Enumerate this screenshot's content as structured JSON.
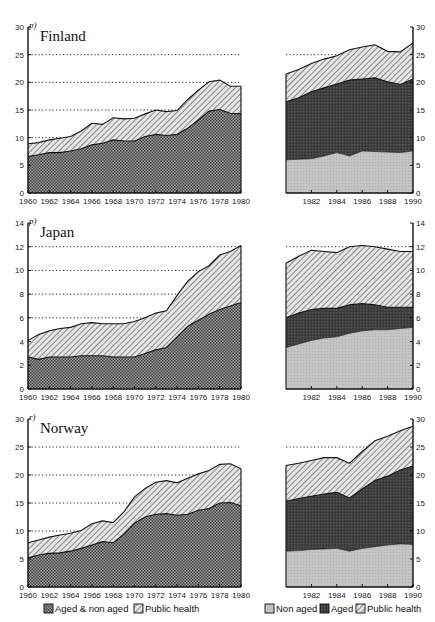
{
  "legend_left": [
    {
      "label": "Aged & non aged",
      "pattern": "checker"
    },
    {
      "label": "Public health",
      "pattern": "hatch"
    }
  ],
  "legend_right": [
    {
      "label": "Non aged",
      "pattern": "lightgray"
    },
    {
      "label": "Aged",
      "pattern": "dark"
    },
    {
      "label": "Public health",
      "pattern": "hatch"
    }
  ],
  "chart_data": [
    {
      "type": "area",
      "title": "Finland",
      "note": "p)",
      "ylim": [
        0,
        30
      ],
      "yticks": [
        0,
        5,
        10,
        15,
        20,
        25,
        30
      ],
      "grid": "dotted at 10,15,20,25",
      "left_panel": {
        "x": [
          1960,
          1961,
          1962,
          1963,
          1964,
          1965,
          1966,
          1967,
          1968,
          1969,
          1970,
          1971,
          1972,
          1973,
          1974,
          1975,
          1976,
          1977,
          1978,
          1979,
          1980
        ],
        "series": [
          {
            "name": "Aged & non aged",
            "values": [
              6.6,
              6.9,
              7.3,
              7.3,
              7.6,
              8.0,
              8.7,
              9.0,
              9.6,
              9.4,
              9.4,
              10.2,
              10.6,
              10.4,
              10.6,
              11.7,
              13.2,
              14.8,
              15.1,
              14.4,
              14.3
            ]
          },
          {
            "name": "Public health (total)",
            "values": [
              8.9,
              9.1,
              9.6,
              9.9,
              10.2,
              11.2,
              12.6,
              12.4,
              13.6,
              13.4,
              13.5,
              14.3,
              15.0,
              14.7,
              14.9,
              16.9,
              18.6,
              20.1,
              20.4,
              19.3,
              19.3
            ]
          }
        ]
      },
      "right_panel": {
        "x": [
          1980,
          1981,
          1982,
          1983,
          1984,
          1985,
          1986,
          1987,
          1988,
          1989,
          1990
        ],
        "series": [
          {
            "name": "Non aged",
            "values": [
              6.0,
              6.1,
              6.2,
              6.7,
              7.3,
              6.7,
              7.6,
              7.5,
              7.4,
              7.3,
              7.6
            ]
          },
          {
            "name": "Aged (total)",
            "values": [
              16.5,
              17.2,
              18.3,
              19.0,
              19.7,
              20.4,
              20.6,
              20.8,
              20.1,
              19.6,
              20.6
            ]
          },
          {
            "name": "Public health (total)",
            "values": [
              21.5,
              22.3,
              23.4,
              24.2,
              24.8,
              25.9,
              26.4,
              26.8,
              25.6,
              25.5,
              27.1
            ]
          }
        ]
      },
      "xticks_left": [
        "1960",
        "1962",
        "1964",
        "1966",
        "1968",
        "1970",
        "1972",
        "1974",
        "1976",
        "1978",
        "1980"
      ],
      "xticks_right": [
        "1982",
        "1984",
        "1986",
        "1988",
        "1990"
      ]
    },
    {
      "type": "area",
      "title": "Japan",
      "note": "p)",
      "ylim": [
        0,
        14
      ],
      "yticks": [
        0,
        2,
        4,
        6,
        8,
        10,
        12,
        14
      ],
      "grid": "dotted at 6,8,10,12",
      "left_panel": {
        "x": [
          1960,
          1961,
          1962,
          1963,
          1964,
          1965,
          1966,
          1967,
          1968,
          1969,
          1970,
          1971,
          1972,
          1973,
          1974,
          1975,
          1976,
          1977,
          1978,
          1979,
          1980
        ],
        "series": [
          {
            "name": "Aged & non aged",
            "values": [
              2.7,
              2.5,
              2.7,
              2.7,
              2.7,
              2.8,
              2.8,
              2.8,
              2.7,
              2.7,
              2.7,
              3.0,
              3.3,
              3.5,
              4.4,
              5.3,
              5.8,
              6.3,
              6.7,
              7.0,
              7.3
            ]
          },
          {
            "name": "Public health (total)",
            "values": [
              4.1,
              4.6,
              4.9,
              5.1,
              5.2,
              5.5,
              5.6,
              5.5,
              5.5,
              5.5,
              5.7,
              6.0,
              6.4,
              6.6,
              7.9,
              9.1,
              9.9,
              10.4,
              11.3,
              11.6,
              12.1
            ]
          }
        ]
      },
      "right_panel": {
        "x": [
          1980,
          1981,
          1982,
          1983,
          1984,
          1985,
          1986,
          1987,
          1988,
          1989,
          1990
        ],
        "series": [
          {
            "name": "Non aged",
            "values": [
              3.5,
              3.8,
              4.1,
              4.3,
              4.4,
              4.7,
              4.9,
              5.0,
              5.0,
              5.1,
              5.2
            ]
          },
          {
            "name": "Aged (total)",
            "values": [
              6.0,
              6.4,
              6.7,
              6.8,
              6.8,
              7.1,
              7.2,
              7.1,
              6.9,
              6.9,
              6.9
            ]
          },
          {
            "name": "Public health (total)",
            "values": [
              10.6,
              11.2,
              11.7,
              11.6,
              11.5,
              12.0,
              12.1,
              12.0,
              11.8,
              11.6,
              11.6
            ]
          }
        ]
      },
      "xticks_left": [
        "1960",
        "1962",
        "1964",
        "1966",
        "1968",
        "1970",
        "1972",
        "1974",
        "1976",
        "1978",
        "1980"
      ],
      "xticks_right": [
        "1982",
        "1984",
        "1986",
        "1988",
        "1990"
      ]
    },
    {
      "type": "area",
      "title": "Norway",
      "note": "r)",
      "ylim": [
        0,
        30
      ],
      "yticks": [
        0,
        5,
        10,
        15,
        20,
        25,
        30
      ],
      "grid": "dotted at 10,15,20,25",
      "left_panel": {
        "x": [
          1960,
          1961,
          1962,
          1963,
          1964,
          1965,
          1966,
          1967,
          1968,
          1969,
          1970,
          1971,
          1972,
          1973,
          1974,
          1975,
          1976,
          1977,
          1978,
          1979,
          1980
        ],
        "series": [
          {
            "name": "Aged & non aged",
            "values": [
              5.2,
              5.7,
              6.0,
              6.1,
              6.4,
              6.9,
              7.5,
              8.1,
              7.9,
              9.4,
              11.4,
              12.5,
              13.0,
              13.1,
              12.8,
              13.0,
              13.7,
              14.0,
              15.0,
              15.1,
              14.5
            ]
          },
          {
            "name": "Public health (total)",
            "values": [
              7.9,
              8.4,
              8.9,
              9.3,
              9.6,
              10.1,
              11.3,
              11.8,
              11.5,
              13.4,
              16.1,
              17.6,
              18.7,
              19.0,
              18.6,
              19.4,
              20.2,
              20.8,
              21.9,
              22.0,
              21.1
            ]
          }
        ]
      },
      "right_panel": {
        "x": [
          1980,
          1981,
          1982,
          1983,
          1984,
          1985,
          1986,
          1987,
          1988,
          1989,
          1990
        ],
        "series": [
          {
            "name": "Non aged",
            "values": [
              6.4,
              6.5,
              6.7,
              6.8,
              6.9,
              6.4,
              6.9,
              7.2,
              7.5,
              7.7,
              7.6
            ]
          },
          {
            "name": "Aged (total)",
            "values": [
              15.3,
              15.8,
              16.2,
              16.6,
              16.9,
              15.9,
              17.5,
              19.0,
              19.8,
              20.9,
              21.6
            ]
          },
          {
            "name": "Public health (total)",
            "values": [
              21.7,
              22.1,
              22.6,
              23.1,
              23.1,
              22.1,
              24.2,
              26.1,
              26.9,
              27.9,
              28.7
            ]
          }
        ]
      },
      "xticks_left": [
        "1960",
        "1962",
        "1964",
        "1966",
        "1968",
        "1970",
        "1972",
        "1974",
        "1976",
        "1978",
        "1980"
      ],
      "xticks_right": [
        "1982",
        "1984",
        "1986",
        "1988",
        "1990"
      ]
    }
  ]
}
